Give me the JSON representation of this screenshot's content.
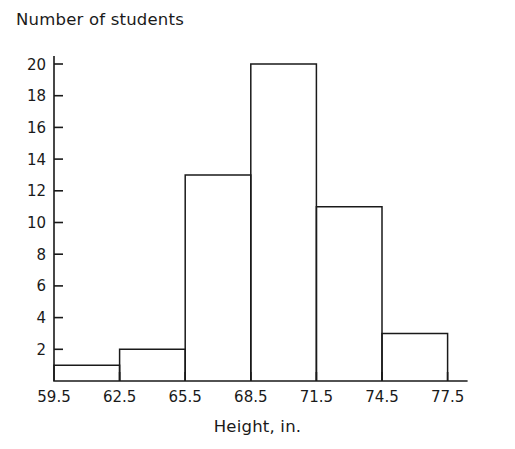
{
  "chart_data": {
    "type": "bar",
    "title": "",
    "ylabel": "Number of students",
    "xlabel": "Height, in.",
    "categories": [
      "59.5-62.5",
      "62.5-65.5",
      "65.5-68.5",
      "68.5-71.5",
      "71.5-74.5",
      "74.5-77.5"
    ],
    "bin_edges": [
      59.5,
      62.5,
      65.5,
      68.5,
      71.5,
      74.5,
      77.5
    ],
    "values": [
      1,
      2,
      13,
      20,
      11,
      3
    ],
    "xtick_labels": [
      "59.5",
      "62.5",
      "65.5",
      "68.5",
      "71.5",
      "74.5",
      "77.5"
    ],
    "ytick_labels": [
      "2",
      "4",
      "6",
      "8",
      "10",
      "12",
      "14",
      "16",
      "18",
      "20"
    ],
    "ytick_values": [
      2,
      4,
      6,
      8,
      10,
      12,
      14,
      16,
      18,
      20
    ],
    "ylim": [
      0,
      21
    ],
    "xlim": [
      59.5,
      77.5
    ],
    "grid": false,
    "legend": null,
    "bar_fill": "#ffffff",
    "bar_stroke": "#1a1a1a",
    "axis_color": "#1a1a1a"
  }
}
